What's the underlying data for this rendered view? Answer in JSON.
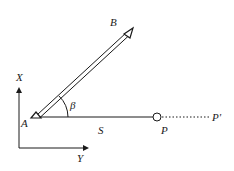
{
  "diagram": {
    "title": "",
    "labels": {
      "B": "B",
      "X": "X",
      "A": "A",
      "beta": "β",
      "S": "S",
      "P": "P",
      "P_prime": "P'",
      "Y": "Y"
    },
    "points": {
      "A": {
        "x": 37,
        "y": 117,
        "symbol": "triangle"
      },
      "B": {
        "x": 130,
        "y": 32,
        "symbol": "triangle"
      },
      "P": {
        "x": 157,
        "y": 117,
        "symbol": "circle"
      },
      "P_prime": {
        "x": 213,
        "y": 117,
        "symbol": "none"
      }
    },
    "edges": [
      {
        "from": "A",
        "to": "B",
        "style": "double-line"
      },
      {
        "from": "A",
        "to": "P",
        "style": "solid",
        "label": "S"
      },
      {
        "from": "P",
        "to": "P_prime",
        "style": "dotted"
      }
    ],
    "angle": {
      "vertex": "A",
      "between": [
        "AB",
        "AP"
      ],
      "label": "β"
    },
    "axes": {
      "x_axis_label": "X",
      "y_axis_label": "Y",
      "origin": {
        "x": 19,
        "y": 148
      }
    },
    "colors": {
      "stroke": "#1a1a1a",
      "background": "#ffffff"
    }
  }
}
